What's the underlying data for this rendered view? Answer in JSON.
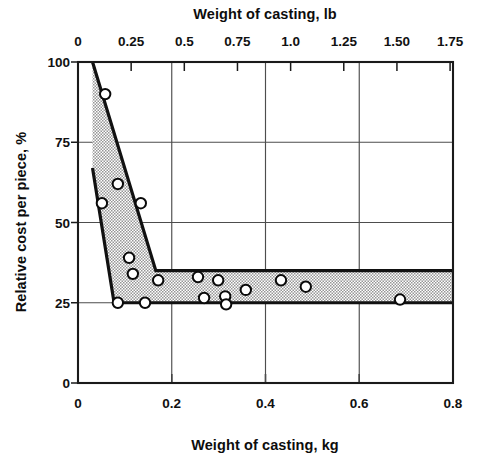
{
  "chart_data": {
    "type": "area",
    "title": "",
    "subtitle": "",
    "top_axis": {
      "label": "Weight of casting, lb",
      "ticks": [
        0,
        0.25,
        0.5,
        0.75,
        1.0,
        1.25,
        1.5,
        1.75
      ],
      "tick_labels": [
        "0",
        "0.25",
        "0.5",
        "0.75",
        "1.0",
        "1.25",
        "1.50",
        "1.75"
      ],
      "range": [
        0,
        1.7637
      ]
    },
    "xlabel": "Weight of casting, kg",
    "x_ticks": [
      0,
      0.2,
      0.4,
      0.6,
      0.8
    ],
    "x_tick_labels": [
      "0",
      "0.2",
      "0.4",
      "0.6",
      "0.8"
    ],
    "xlim": [
      0,
      0.8
    ],
    "ylabel": "Relative cost per piece, %",
    "y_ticks": [
      0,
      25,
      50,
      75,
      100
    ],
    "y_tick_labels": [
      "0",
      "25",
      "50",
      "75",
      "100"
    ],
    "ylim": [
      0,
      100
    ],
    "grid": "xy-major",
    "legend": "none",
    "band": {
      "name": "Relative cost band",
      "fill_color": "#cccccc",
      "edge_color": "#111111",
      "upper_bound": [
        {
          "x": 0.031,
          "y": 100
        },
        {
          "x": 0.166,
          "y": 35
        },
        {
          "x": 0.8,
          "y": 35
        }
      ],
      "lower_bound": [
        {
          "x": 0.031,
          "y": 67
        },
        {
          "x": 0.077,
          "y": 25
        },
        {
          "x": 0.8,
          "y": 25
        }
      ]
    },
    "series": [
      {
        "name": "Measured castings",
        "marker": "open-circle",
        "points": [
          {
            "x": 0.058,
            "y": 90
          },
          {
            "x": 0.085,
            "y": 62
          },
          {
            "x": 0.051,
            "y": 56
          },
          {
            "x": 0.134,
            "y": 56
          },
          {
            "x": 0.109,
            "y": 39
          },
          {
            "x": 0.117,
            "y": 34
          },
          {
            "x": 0.171,
            "y": 32
          },
          {
            "x": 0.085,
            "y": 25
          },
          {
            "x": 0.143,
            "y": 25
          },
          {
            "x": 0.256,
            "y": 33
          },
          {
            "x": 0.269,
            "y": 26.5
          },
          {
            "x": 0.299,
            "y": 32
          },
          {
            "x": 0.314,
            "y": 27
          },
          {
            "x": 0.316,
            "y": 24.5
          },
          {
            "x": 0.358,
            "y": 29
          },
          {
            "x": 0.433,
            "y": 32
          },
          {
            "x": 0.486,
            "y": 30
          },
          {
            "x": 0.687,
            "y": 26
          }
        ]
      }
    ]
  }
}
